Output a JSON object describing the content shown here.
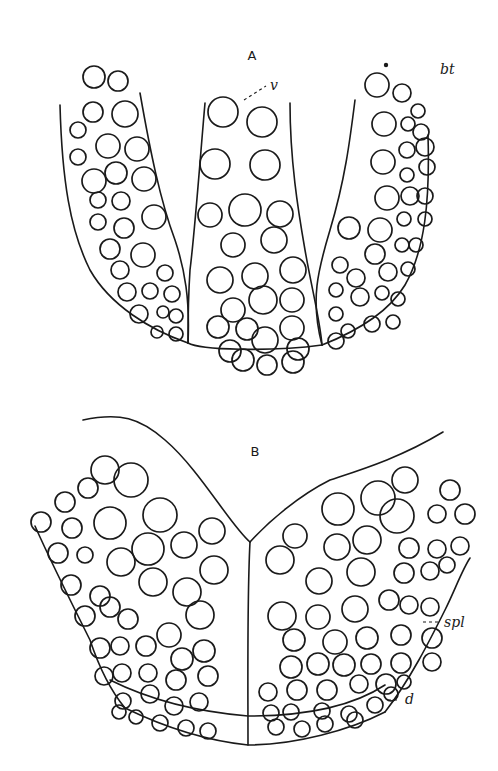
{
  "figure": {
    "panels": [
      {
        "id": "A",
        "label": "A",
        "label_pos": [
          252,
          60
        ],
        "annotations": [
          {
            "text": "v",
            "pos": [
              270,
              90
            ],
            "leader": [
              [
                244,
                100
              ],
              [
                266,
                86
              ]
            ]
          },
          {
            "text": "bt",
            "pos": [
              440,
              74
            ],
            "leader": null
          }
        ],
        "dot": [
          386,
          65
        ],
        "outlines": [
          "M60 105 C 62 180, 70 230, 90 270 C 110 305, 150 330, 188 343",
          "M140 93 C 150 150, 160 200, 175 240 C 185 270, 190 300, 188 343",
          "M205 103 C 200 160, 195 230, 190 270 C 188 300, 188 325, 188 343",
          "M188 343 C 200 350, 270 352, 322 345",
          "M290 103 C 290 160, 298 210, 305 250 C 312 290, 320 320, 322 345",
          "M355 100 C 350 140, 345 180, 330 230 C 318 270, 310 300, 322 345",
          "M428 135 C 430 200, 425 250, 405 285 C 390 310, 360 330, 322 345"
        ],
        "cells": [
          [
            94,
            77,
            11
          ],
          [
            118,
            81,
            10
          ],
          [
            93,
            112,
            10
          ],
          [
            125,
            114,
            13
          ],
          [
            78,
            130,
            8
          ],
          [
            108,
            146,
            12
          ],
          [
            137,
            149,
            12
          ],
          [
            78,
            157,
            8
          ],
          [
            94,
            181,
            12
          ],
          [
            116,
            173,
            11
          ],
          [
            144,
            179,
            12
          ],
          [
            98,
            200,
            8
          ],
          [
            121,
            201,
            9
          ],
          [
            98,
            222,
            8
          ],
          [
            124,
            228,
            10
          ],
          [
            154,
            217,
            12
          ],
          [
            110,
            249,
            10
          ],
          [
            143,
            255,
            12
          ],
          [
            120,
            270,
            9
          ],
          [
            165,
            273,
            8
          ],
          [
            127,
            292,
            9
          ],
          [
            150,
            291,
            8
          ],
          [
            172,
            294,
            8
          ],
          [
            139,
            314,
            9
          ],
          [
            163,
            312,
            6
          ],
          [
            176,
            316,
            7
          ],
          [
            157,
            332,
            6
          ],
          [
            176,
            334,
            7
          ],
          [
            223,
            112,
            15
          ],
          [
            262,
            122,
            15
          ],
          [
            215,
            164,
            15
          ],
          [
            265,
            165,
            15
          ],
          [
            210,
            215,
            12
          ],
          [
            245,
            210,
            16
          ],
          [
            280,
            214,
            13
          ],
          [
            233,
            245,
            12
          ],
          [
            274,
            240,
            13
          ],
          [
            220,
            280,
            13
          ],
          [
            255,
            276,
            13
          ],
          [
            293,
            270,
            13
          ],
          [
            233,
            310,
            12
          ],
          [
            263,
            300,
            14
          ],
          [
            292,
            300,
            12
          ],
          [
            218,
            327,
            11
          ],
          [
            247,
            329,
            11
          ],
          [
            292,
            328,
            12
          ],
          [
            230,
            351,
            11
          ],
          [
            265,
            340,
            13
          ],
          [
            298,
            349,
            11
          ],
          [
            243,
            360,
            11
          ],
          [
            267,
            365,
            10
          ],
          [
            293,
            362,
            11
          ],
          [
            377,
            85,
            12
          ],
          [
            402,
            93,
            9
          ],
          [
            418,
            111,
            7
          ],
          [
            384,
            124,
            12
          ],
          [
            408,
            124,
            7
          ],
          [
            421,
            132,
            8
          ],
          [
            383,
            162,
            12
          ],
          [
            407,
            150,
            8
          ],
          [
            425,
            147,
            9
          ],
          [
            407,
            175,
            7
          ],
          [
            427,
            167,
            8
          ],
          [
            387,
            198,
            12
          ],
          [
            410,
            196,
            9
          ],
          [
            425,
            196,
            8
          ],
          [
            349,
            228,
            11
          ],
          [
            380,
            230,
            12
          ],
          [
            404,
            219,
            7
          ],
          [
            425,
            219,
            7
          ],
          [
            375,
            254,
            10
          ],
          [
            402,
            245,
            7
          ],
          [
            416,
            245,
            7
          ],
          [
            340,
            265,
            8
          ],
          [
            356,
            278,
            9
          ],
          [
            388,
            272,
            9
          ],
          [
            408,
            269,
            7
          ],
          [
            336,
            290,
            7
          ],
          [
            360,
            297,
            9
          ],
          [
            382,
            293,
            7
          ],
          [
            398,
            299,
            7
          ],
          [
            336,
            314,
            7
          ],
          [
            348,
            331,
            7
          ],
          [
            372,
            324,
            8
          ],
          [
            393,
            322,
            7
          ],
          [
            336,
            341,
            8
          ]
        ]
      },
      {
        "id": "B",
        "label": "B",
        "label_pos": [
          255,
          456
        ],
        "annotations": [
          {
            "text": "spl",
            "pos": [
              444,
              627
            ],
            "leader": [
              [
                423,
                622
              ],
              [
                441,
                622
              ]
            ]
          },
          {
            "text": "d",
            "pos": [
              405,
              704
            ],
            "leader": [
              [
                388,
                700
              ],
              [
                398,
                700
              ]
            ]
          }
        ],
        "dot": null,
        "outlines": [
          "M83 420 C 120 412, 140 418, 165 440 C 200 470, 230 525, 250 542",
          "M250 542 C 270 520, 300 495, 330 480 C 360 470, 400 458, 443 432",
          "M250 542 C 247 600, 248 680, 248 745",
          "M35 526 C 50 560, 70 600, 90 640 C 100 670, 110 690, 125 708",
          "M125 708 C 160 725, 200 740, 248 745 C 295 745, 350 730, 385 712",
          "M385 712 C 410 680, 430 640, 445 610 C 455 590, 462 570, 470 558",
          "M110 680 C 150 700, 200 712, 248 716 C 300 716, 350 708, 385 685"
        ],
        "cells": [
          [
            65,
            502,
            10
          ],
          [
            88,
            488,
            10
          ],
          [
            105,
            470,
            14
          ],
          [
            131,
            480,
            17
          ],
          [
            41,
            522,
            10
          ],
          [
            72,
            528,
            10
          ],
          [
            110,
            523,
            16
          ],
          [
            160,
            515,
            17
          ],
          [
            58,
            553,
            10
          ],
          [
            85,
            555,
            8
          ],
          [
            121,
            562,
            14
          ],
          [
            148,
            549,
            16
          ],
          [
            184,
            545,
            13
          ],
          [
            212,
            531,
            13
          ],
          [
            71,
            585,
            10
          ],
          [
            100,
            596,
            10
          ],
          [
            153,
            582,
            14
          ],
          [
            187,
            592,
            14
          ],
          [
            214,
            570,
            14
          ],
          [
            85,
            616,
            10
          ],
          [
            110,
            607,
            10
          ],
          [
            128,
            619,
            10
          ],
          [
            169,
            635,
            12
          ],
          [
            200,
            615,
            14
          ],
          [
            100,
            648,
            10
          ],
          [
            120,
            646,
            9
          ],
          [
            146,
            646,
            10
          ],
          [
            182,
            659,
            11
          ],
          [
            204,
            651,
            11
          ],
          [
            104,
            676,
            9
          ],
          [
            122,
            673,
            9
          ],
          [
            148,
            673,
            9
          ],
          [
            176,
            680,
            10
          ],
          [
            208,
            676,
            10
          ],
          [
            123,
            701,
            8
          ],
          [
            150,
            694,
            9
          ],
          [
            174,
            706,
            9
          ],
          [
            199,
            702,
            9
          ],
          [
            119,
            712,
            7
          ],
          [
            136,
            717,
            7
          ],
          [
            160,
            723,
            8
          ],
          [
            186,
            728,
            8
          ],
          [
            208,
            731,
            8
          ],
          [
            378,
            498,
            17
          ],
          [
            405,
            480,
            13
          ],
          [
            450,
            490,
            10
          ],
          [
            338,
            509,
            16
          ],
          [
            397,
            516,
            17
          ],
          [
            437,
            514,
            9
          ],
          [
            465,
            514,
            10
          ],
          [
            295,
            536,
            12
          ],
          [
            337,
            547,
            13
          ],
          [
            367,
            540,
            14
          ],
          [
            409,
            548,
            10
          ],
          [
            437,
            549,
            9
          ],
          [
            460,
            546,
            9
          ],
          [
            280,
            560,
            14
          ],
          [
            361,
            572,
            14
          ],
          [
            404,
            573,
            10
          ],
          [
            430,
            571,
            9
          ],
          [
            447,
            565,
            8
          ],
          [
            319,
            581,
            13
          ],
          [
            282,
            616,
            14
          ],
          [
            318,
            617,
            12
          ],
          [
            355,
            609,
            13
          ],
          [
            389,
            600,
            10
          ],
          [
            409,
            605,
            9
          ],
          [
            430,
            607,
            9
          ],
          [
            294,
            640,
            11
          ],
          [
            335,
            642,
            12
          ],
          [
            367,
            638,
            11
          ],
          [
            401,
            635,
            10
          ],
          [
            432,
            638,
            10
          ],
          [
            291,
            667,
            11
          ],
          [
            318,
            664,
            11
          ],
          [
            344,
            665,
            11
          ],
          [
            371,
            664,
            10
          ],
          [
            401,
            663,
            10
          ],
          [
            432,
            662,
            9
          ],
          [
            268,
            692,
            9
          ],
          [
            297,
            690,
            10
          ],
          [
            327,
            690,
            10
          ],
          [
            359,
            684,
            9
          ],
          [
            386,
            684,
            10
          ],
          [
            404,
            682,
            7
          ],
          [
            271,
            713,
            8
          ],
          [
            291,
            712,
            8
          ],
          [
            322,
            711,
            8
          ],
          [
            349,
            714,
            8
          ],
          [
            375,
            705,
            8
          ],
          [
            391,
            694,
            7
          ],
          [
            276,
            727,
            8
          ],
          [
            302,
            729,
            8
          ],
          [
            325,
            724,
            8
          ],
          [
            355,
            720,
            8
          ]
        ]
      }
    ]
  }
}
